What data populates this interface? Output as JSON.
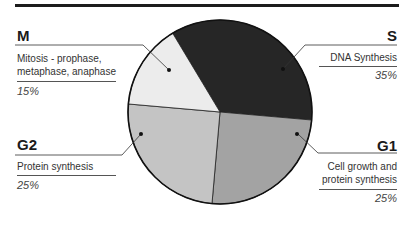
{
  "chart_data": {
    "type": "pie",
    "title": "",
    "slices": [
      {
        "label": "S",
        "description": "DNA Synthesis",
        "value": 35,
        "percent_label": "35%",
        "color": "#262626"
      },
      {
        "label": "G1",
        "description": "Cell growth and protein synthesis",
        "value": 25,
        "percent_label": "25%",
        "color": "#a3a3a3"
      },
      {
        "label": "G2",
        "description": "Protein synthesis",
        "value": 25,
        "percent_label": "25%",
        "color": "#c4c4c4"
      },
      {
        "label": "M",
        "description": "Mitosis - prophase, metaphase, anaphase",
        "value": 15,
        "percent_label": "15%",
        "color": "#ececec"
      }
    ],
    "start_angle_deg": -31,
    "legend_position": "callouts"
  },
  "labels": {
    "m": {
      "code": "M",
      "line1": "Mitosis - prophase,",
      "line2": "metaphase, anaphase",
      "pct": "15%"
    },
    "s": {
      "code": "S",
      "line1": "DNA Synthesis",
      "pct": "35%"
    },
    "g2": {
      "code": "G2",
      "line1": "Protein synthesis",
      "pct": "25%"
    },
    "g1": {
      "code": "G1",
      "line1": "Cell growth and",
      "line2": "protein synthesis",
      "pct": "25%"
    }
  }
}
